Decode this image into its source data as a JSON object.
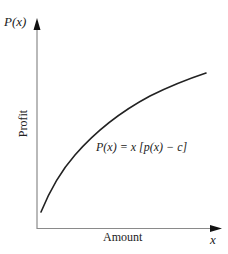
{
  "figure": {
    "y_axis_title": "P(x)",
    "x_axis_title": "x",
    "y_axis_label": "Profit",
    "x_axis_label": "Amount",
    "formula": "P(x) = x [p(x) − c]",
    "colors": {
      "axis": "#8a8a8a",
      "curve": "#222222",
      "arrow": "#111111",
      "text": "#222222"
    }
  }
}
